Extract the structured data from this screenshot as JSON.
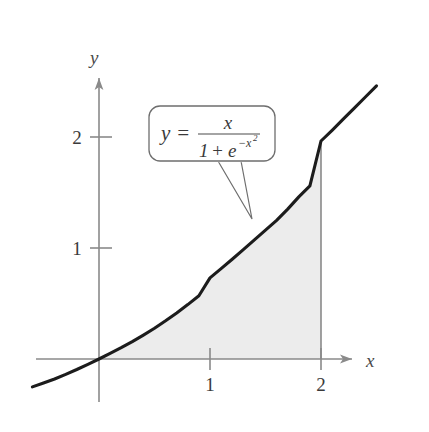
{
  "figure": {
    "title": "",
    "background_color": "#ffffff",
    "curve_color": "#1c1c1c",
    "axis_color": "#8a8a8a",
    "shade_color": "#ececec",
    "callout_border_color": "#6e6e6e",
    "text_color": "#4a4a4a"
  },
  "axes": {
    "x_axis_label": "x",
    "y_axis_label": "y",
    "x_ticks": [
      "1",
      "2"
    ],
    "y_ticks": [
      "1",
      "2"
    ],
    "x_tick_values": [
      1,
      2
    ],
    "y_tick_values": [
      1,
      2
    ]
  },
  "callout": {
    "name": "function-label",
    "lhs": "y",
    "equals": "=",
    "numerator": "x",
    "denominator_one": "1",
    "denominator_plus": "+",
    "denominator_e": "e",
    "denominator_exponent_sign": "−",
    "denominator_exponent_base": "x",
    "denominator_exponent_power": "2",
    "full_text": "y = x / (1 + e^(-x^2))"
  },
  "chart_data": {
    "type": "line",
    "title": "",
    "xlabel": "x",
    "ylabel": "y",
    "xlim": [
      -0.6,
      2.5
    ],
    "ylim": [
      -0.4,
      2.8
    ],
    "grid": false,
    "legend": "none",
    "function": "y = x / (1 + e^(-x^2))",
    "shaded_region": {
      "label": "area under curve",
      "x_from": 0,
      "x_to": 2,
      "bounded_below_by": "x-axis",
      "bounded_above_by": "curve",
      "fill": "#ececec"
    },
    "boundary_line": {
      "label": "vertical line at x = 2",
      "x": 2,
      "y_from": 0,
      "y_to": 1.9643
    },
    "x": [
      -0.6,
      -0.5,
      -0.4,
      -0.3,
      -0.2,
      -0.1,
      0.0,
      0.1,
      0.2,
      0.3,
      0.4,
      0.5,
      0.6,
      0.7,
      0.8,
      0.9,
      1.0,
      1.1,
      1.2,
      1.3,
      1.4,
      1.5,
      1.6,
      1.7,
      1.8,
      1.9,
      2.0,
      2.1,
      2.2,
      2.3,
      2.4,
      2.5
    ],
    "y": [
      -0.251,
      -0.216,
      -0.18,
      -0.139,
      -0.095,
      -0.048,
      0.0,
      0.05,
      0.102,
      0.157,
      0.215,
      0.277,
      0.344,
      0.415,
      0.49,
      0.569,
      0.731,
      0.814,
      0.899,
      0.986,
      1.074,
      1.16,
      1.25,
      1.35,
      1.46,
      1.56,
      1.964,
      2.06,
      2.16,
      2.26,
      2.36,
      2.46
    ]
  }
}
